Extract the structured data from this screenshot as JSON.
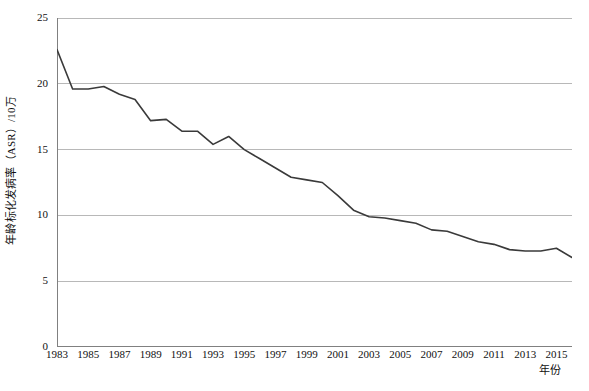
{
  "chart_data": {
    "type": "line",
    "title": "",
    "xlabel": "年份",
    "ylabel": "年龄标化发病率（ASR）/10万",
    "xlim": [
      1983,
      2016
    ],
    "ylim": [
      0,
      25
    ],
    "ytick_labels": [
      "25",
      "20",
      "15",
      "10",
      "5",
      "0"
    ],
    "ytick_values": [
      25,
      20,
      15,
      10,
      5,
      0
    ],
    "xtick_labels": [
      "1983",
      "1985",
      "1987",
      "1989",
      "1991",
      "1993",
      "1995",
      "1997",
      "1999",
      "2001",
      "2003",
      "2005",
      "2007",
      "2009",
      "2011",
      "2013",
      "2015"
    ],
    "xtick_values": [
      1983,
      1985,
      1987,
      1989,
      1991,
      1993,
      1995,
      1997,
      1999,
      2001,
      2003,
      2005,
      2007,
      2009,
      2011,
      2013,
      2015
    ],
    "grid": "horizontal",
    "legend": "none",
    "line_color": "#3a3a3a",
    "grid_color": "#b8b8b8",
    "axis_color": "#808080",
    "x": [
      1983,
      1984,
      1985,
      1986,
      1987,
      1988,
      1989,
      1990,
      1991,
      1992,
      1993,
      1994,
      1995,
      1996,
      1997,
      1998,
      1999,
      2000,
      2001,
      2002,
      2003,
      2004,
      2005,
      2006,
      2007,
      2008,
      2009,
      2010,
      2011,
      2012,
      2013,
      2014,
      2015,
      2016
    ],
    "values": [
      22.6,
      19.6,
      19.6,
      19.8,
      19.2,
      18.8,
      17.2,
      17.3,
      16.4,
      16.4,
      15.4,
      16.0,
      15.0,
      14.3,
      13.6,
      12.9,
      12.7,
      12.5,
      11.5,
      10.4,
      9.9,
      9.8,
      9.6,
      9.4,
      8.9,
      8.8,
      8.4,
      8.0,
      7.8,
      7.4,
      7.3,
      7.3,
      7.5,
      6.8
    ],
    "series": [
      {
        "name": "年龄标化发病率（ASR）/10万",
        "values": [
          22.6,
          19.6,
          19.6,
          19.8,
          19.2,
          18.8,
          17.2,
          17.3,
          16.4,
          16.4,
          15.4,
          16.0,
          15.0,
          14.3,
          13.6,
          12.9,
          12.7,
          12.5,
          11.5,
          10.4,
          9.9,
          9.8,
          9.6,
          9.4,
          8.9,
          8.8,
          8.4,
          8.0,
          7.8,
          7.4,
          7.3,
          7.3,
          7.5,
          6.8
        ]
      }
    ]
  },
  "axes": {
    "y_title": "年龄标化发病率（ASR）/10万",
    "x_title": "年份"
  },
  "caption": ""
}
